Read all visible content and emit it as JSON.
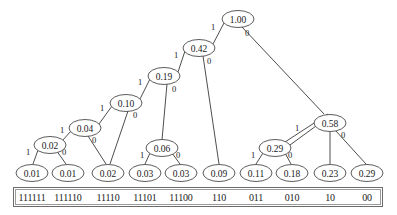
{
  "figure": {
    "type": "huffman-coding-tree",
    "title": "",
    "node_fill": "#ffffff",
    "node_stroke": "#4a4a4a",
    "edge_stroke": "#3a3a3a",
    "text_color": "#1a1a1a",
    "box_stroke": "#6b6b6b",
    "background": "#ffffff"
  },
  "tree": {
    "root_label": "1.00",
    "internal_nodes": [
      {
        "id": "n-root",
        "label": "1.00",
        "cx": 238,
        "cy": 19
      },
      {
        "id": "n-042",
        "label": "0.42",
        "cx": 199,
        "cy": 48
      },
      {
        "id": "n-019",
        "label": "0.19",
        "cx": 164,
        "cy": 76
      },
      {
        "id": "n-010",
        "label": "0.10",
        "cx": 126,
        "cy": 103
      },
      {
        "id": "n-004",
        "label": "0.04",
        "cx": 85,
        "cy": 128
      },
      {
        "id": "n-002",
        "label": "0.02",
        "cx": 50,
        "cy": 145
      },
      {
        "id": "n-006",
        "label": "0.06",
        "cx": 162,
        "cy": 148
      },
      {
        "id": "n-058",
        "label": "0.58",
        "cx": 330,
        "cy": 123
      },
      {
        "id": "n-029i",
        "label": "0.29",
        "cx": 275,
        "cy": 148
      }
    ],
    "leaves": [
      {
        "id": "leaf-1",
        "label": "0.01",
        "code": "111111",
        "cx": 32,
        "cy": 173
      },
      {
        "id": "leaf-2",
        "label": "0.01",
        "code": "111110",
        "cx": 68,
        "cy": 173
      },
      {
        "id": "leaf-3",
        "label": "0.02",
        "code": "11110",
        "cx": 108,
        "cy": 173
      },
      {
        "id": "leaf-4",
        "label": "0.03",
        "code": "11101",
        "cx": 145,
        "cy": 173
      },
      {
        "id": "leaf-5",
        "label": "0.03",
        "code": "11100",
        "cx": 181,
        "cy": 173
      },
      {
        "id": "leaf-6",
        "label": "0.09",
        "code": "110",
        "cx": 219,
        "cy": 173
      },
      {
        "id": "leaf-7",
        "label": "0.11",
        "code": "011",
        "cx": 256,
        "cy": 173
      },
      {
        "id": "leaf-8",
        "label": "0.18",
        "code": "010",
        "cx": 292,
        "cy": 173
      },
      {
        "id": "leaf-9",
        "label": "0.23",
        "code": "10",
        "cx": 330,
        "cy": 173
      },
      {
        "id": "leaf-10",
        "label": "0.29",
        "code": "00",
        "cx": 367,
        "cy": 173
      }
    ],
    "edges": [
      {
        "from": "n-root",
        "to": "n-042",
        "bit": "1",
        "x1": 224,
        "y1": 23,
        "x2": 213,
        "y2": 44,
        "lx": 213,
        "ly": 27
      },
      {
        "from": "n-root",
        "to": "n-058",
        "bit": "0",
        "x1": 242,
        "y1": 27,
        "x2": 324,
        "y2": 114,
        "lx": 247,
        "ly": 33
      },
      {
        "from": "n-042",
        "to": "n-019",
        "bit": "1",
        "x1": 185,
        "y1": 51,
        "x2": 178,
        "y2": 72,
        "lx": 176,
        "ly": 55
      },
      {
        "from": "n-042",
        "to": "leaf-6",
        "bit": "0",
        "x1": 203,
        "y1": 56,
        "x2": 219,
        "y2": 164,
        "lx": 209,
        "ly": 61
      },
      {
        "from": "n-019",
        "to": "n-010",
        "bit": "1",
        "x1": 150,
        "y1": 79,
        "x2": 140,
        "y2": 99,
        "lx": 140,
        "ly": 82
      },
      {
        "from": "n-019",
        "to": "n-006",
        "bit": "0",
        "x1": 167,
        "y1": 84,
        "x2": 162,
        "y2": 140,
        "lx": 174,
        "ly": 89
      },
      {
        "from": "n-010",
        "to": "n-004",
        "bit": "1",
        "x1": 112,
        "y1": 106,
        "x2": 99,
        "y2": 124,
        "lx": 102,
        "ly": 108
      },
      {
        "from": "n-010",
        "to": "leaf-3",
        "bit": "0",
        "x1": 128,
        "y1": 111,
        "x2": 110,
        "y2": 164,
        "lx": 135,
        "ly": 115
      },
      {
        "from": "n-004",
        "to": "n-002",
        "bit": "1",
        "x1": 71,
        "y1": 131,
        "x2": 62,
        "y2": 141,
        "lx": 62,
        "ly": 130
      },
      {
        "from": "n-004",
        "to": "leaf-3",
        "bit": "0",
        "x1": 88,
        "y1": 136,
        "x2": 106,
        "y2": 164,
        "lx": 94,
        "ly": 140
      },
      {
        "from": "n-002",
        "to": "leaf-1",
        "bit": "1",
        "x1": 38,
        "y1": 150,
        "x2": 33,
        "y2": 164,
        "lx": 28,
        "ly": 152
      },
      {
        "from": "n-002",
        "to": "leaf-2",
        "bit": "0",
        "x1": 56,
        "y1": 150,
        "x2": 66,
        "y2": 164,
        "lx": 64,
        "ly": 152
      },
      {
        "from": "n-006",
        "to": "leaf-4",
        "bit": "1",
        "x1": 150,
        "y1": 153,
        "x2": 145,
        "y2": 164,
        "lx": 142,
        "ly": 155
      },
      {
        "from": "n-006",
        "to": "leaf-5",
        "bit": "0",
        "x1": 172,
        "y1": 153,
        "x2": 180,
        "y2": 164,
        "lx": 178,
        "ly": 155
      },
      {
        "from": "n-058",
        "to": "n-029i",
        "bit": "1",
        "x1": 316,
        "y1": 126,
        "x2": 290,
        "y2": 145,
        "lx": 297,
        "ly": 128
      },
      {
        "from": "n-058",
        "to": "leaf-10",
        "bit": "0",
        "x1": 336,
        "y1": 131,
        "x2": 366,
        "y2": 164,
        "lx": 343,
        "ly": 135
      },
      {
        "from": "n-029i",
        "to": "leaf-7",
        "bit": "1",
        "x1": 263,
        "y1": 153,
        "x2": 256,
        "y2": 164,
        "lx": 253,
        "ly": 155
      },
      {
        "from": "n-029i",
        "to": "leaf-8",
        "bit": "0",
        "x1": 285,
        "y1": 153,
        "x2": 291,
        "y2": 164,
        "lx": 290,
        "ly": 155
      },
      {
        "from": "n-029i",
        "to": "leaf-9",
        "bit": "",
        "x1": 285,
        "y1": 142,
        "x2": 328,
        "y2": 114,
        "lx": 0,
        "ly": 0
      },
      {
        "from": "n-058",
        "to": "leaf-9",
        "bit": "",
        "x1": 330,
        "y1": 132,
        "x2": 330,
        "y2": 164,
        "lx": 0,
        "ly": 0
      }
    ]
  },
  "code_box": {
    "codes": [
      "111111",
      "111110",
      "11110",
      "11101",
      "11100",
      "110",
      "011",
      "010",
      "10",
      "00"
    ]
  }
}
